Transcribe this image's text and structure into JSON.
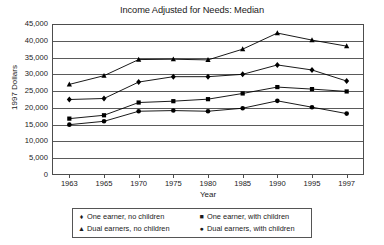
{
  "chart_data": {
    "type": "line",
    "title": "Income Adjusted for Needs: Median",
    "xlabel": "Year",
    "ylabel": "1997 Dollars",
    "grid": true,
    "legend_position": "bottom",
    "ylim": [
      0,
      45000
    ],
    "ytick_step": 5000,
    "categories": [
      "1963",
      "1965",
      "1970",
      "1975",
      "1980",
      "1985",
      "1990",
      "1995",
      "1997"
    ],
    "ytick_labels": [
      "0",
      "5,000",
      "10,000",
      "15,000",
      "20,000",
      "25,000",
      "30,000",
      "35,000",
      "40,000",
      "45,000"
    ],
    "series": [
      {
        "name": "One earner, no children",
        "marker": "diamond",
        "marker_glyph": "♦",
        "color": "#000000",
        "values": [
          22500,
          22800,
          27700,
          29300,
          29300,
          30000,
          32800,
          31300,
          28000
        ]
      },
      {
        "name": "One earner, with children",
        "marker": "square",
        "marker_glyph": "■",
        "color": "#000000",
        "values": [
          16800,
          17800,
          21600,
          22000,
          22600,
          24300,
          26200,
          25600,
          24900
        ]
      },
      {
        "name": "Dual earners, no children",
        "marker": "triangle",
        "marker_glyph": "▲",
        "color": "#000000",
        "values": [
          27000,
          29600,
          34400,
          34500,
          34300,
          37500,
          42300,
          40200,
          38400
        ]
      },
      {
        "name": "Dual earners, with children",
        "marker": "circle",
        "marker_glyph": "●",
        "color": "#000000",
        "values": [
          15000,
          16000,
          19000,
          19200,
          19000,
          19900,
          22100,
          20200,
          18300
        ]
      }
    ]
  }
}
